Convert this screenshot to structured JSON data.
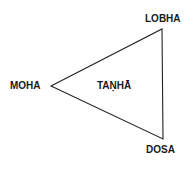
{
  "diagram": {
    "type": "triangle",
    "vertices": {
      "top_right": {
        "label": "LOBHA"
      },
      "left": {
        "label": "MOHA"
      },
      "bottom_right": {
        "label": "DOSA"
      }
    },
    "center_label": "TAṆHĀ",
    "line_color": "#222222"
  }
}
